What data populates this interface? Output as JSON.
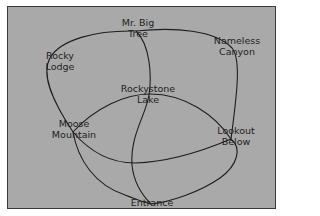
{
  "diagram": {
    "type": "trail-map",
    "background_color": "#a9a9a9",
    "line_color": "#1e1e1e",
    "nodes": [
      {
        "id": "mr-big-tree",
        "line1": "Mr. Big",
        "line2": "Tree"
      },
      {
        "id": "nameless-canyon",
        "line1": "Nameless",
        "line2": "Canyon"
      },
      {
        "id": "rocky-lodge",
        "line1": "Rocky",
        "line2": "Lodge"
      },
      {
        "id": "rockystone-lake",
        "line1": "Rockystone",
        "line2": "Lake"
      },
      {
        "id": "moose-mountain",
        "line1": "Moose",
        "line2": "Mountain"
      },
      {
        "id": "lookout-below",
        "line1": "Lookout",
        "line2": "Below"
      },
      {
        "id": "entrance",
        "line1": "Entrance",
        "line2": ""
      }
    ],
    "edges": [
      {
        "from": "Mr. Big Tree",
        "to": "Moose Mountain",
        "via": "Rocky Lodge"
      },
      {
        "from": "Mr. Big Tree",
        "to": "Lookout Below",
        "via": "Nameless Canyon"
      },
      {
        "from": "Mr. Big Tree",
        "to": "Entrance",
        "via": "Rockystone Lake"
      },
      {
        "from": "Moose Mountain",
        "to": "Lookout Below",
        "via": "Rockystone Lake"
      },
      {
        "from": "Moose Mountain",
        "to": "Lookout Below"
      },
      {
        "from": "Moose Mountain",
        "to": "Entrance"
      },
      {
        "from": "Lookout Below",
        "to": "Entrance"
      }
    ]
  }
}
